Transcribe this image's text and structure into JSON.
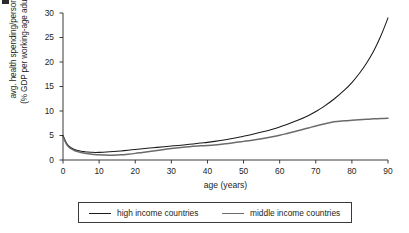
{
  "chart_data": {
    "type": "line",
    "title": "",
    "xlabel": "age (years)",
    "ylabel": "avg. health spending/person\n(% GDP per working-age adult)",
    "ylabel_line1": "avg. health spending/person",
    "ylabel_line2": "(% GDP per working-age adult)",
    "xlim": [
      0,
      90
    ],
    "ylim": [
      0,
      30
    ],
    "xticks": [
      0,
      10,
      20,
      30,
      40,
      50,
      60,
      70,
      80,
      90
    ],
    "yticks": [
      0,
      5,
      10,
      15,
      20,
      25,
      30
    ],
    "xtick_labels": [
      "0",
      "10",
      "20",
      "30",
      "40",
      "50",
      "60",
      "70",
      "80",
      "90"
    ],
    "ytick_labels": [
      "0",
      "5",
      "10",
      "15",
      "20",
      "25",
      "30"
    ],
    "grid": false,
    "legend_position": "below-center",
    "x": [
      0,
      1,
      2,
      3,
      4,
      5,
      6,
      7,
      8,
      9,
      10,
      12,
      14,
      16,
      18,
      20,
      22,
      25,
      28,
      30,
      32,
      35,
      38,
      40,
      42,
      45,
      48,
      50,
      52,
      55,
      58,
      60,
      62,
      65,
      68,
      70,
      72,
      75,
      78,
      80,
      82,
      84,
      86,
      88,
      90
    ],
    "series": [
      {
        "name": "high income countries",
        "color": "#1a1a1a",
        "values": [
          5.0,
          3.4,
          2.6,
          2.2,
          1.95,
          1.8,
          1.7,
          1.62,
          1.57,
          1.55,
          1.56,
          1.62,
          1.72,
          1.85,
          2.0,
          2.15,
          2.3,
          2.5,
          2.72,
          2.85,
          2.98,
          3.2,
          3.45,
          3.6,
          3.8,
          4.15,
          4.55,
          4.85,
          5.15,
          5.7,
          6.3,
          6.75,
          7.25,
          8.1,
          9.1,
          9.9,
          10.8,
          12.4,
          14.3,
          15.8,
          17.6,
          19.7,
          22.2,
          25.3,
          29.0
        ]
      },
      {
        "name": "middle income countries",
        "color": "#6b6b6b",
        "values": [
          4.7,
          3.2,
          2.4,
          2.0,
          1.72,
          1.52,
          1.38,
          1.26,
          1.17,
          1.1,
          1.05,
          1.0,
          0.98,
          1.05,
          1.18,
          1.35,
          1.55,
          1.85,
          2.15,
          2.35,
          2.5,
          2.72,
          2.9,
          2.95,
          3.05,
          3.3,
          3.6,
          3.8,
          4.0,
          4.35,
          4.75,
          5.05,
          5.4,
          5.95,
          6.55,
          6.95,
          7.3,
          7.8,
          8.0,
          8.1,
          8.2,
          8.3,
          8.4,
          8.45,
          8.5
        ]
      }
    ],
    "legend": [
      {
        "label": "high income countries",
        "color": "#1a1a1a"
      },
      {
        "label": "middle income countries",
        "color": "#6b6b6b"
      }
    ]
  },
  "axes": {
    "x_title": "age (years)",
    "y_title_line1": "avg. health spending/person",
    "y_title_line2": "(% GDP per working-age adult)"
  }
}
